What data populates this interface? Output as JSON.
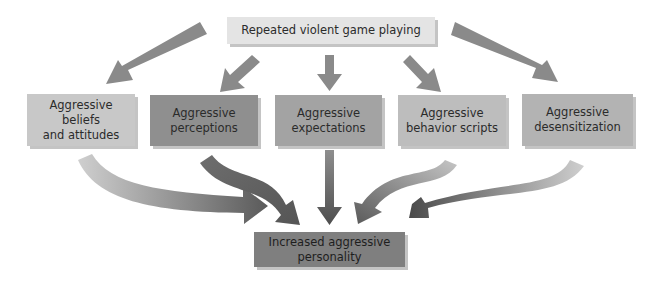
{
  "diagram": {
    "source": {
      "label": "Repeated violent game playing",
      "color": "#e4e4e4"
    },
    "intermediates": [
      {
        "label": "Aggressive beliefs and attitudes",
        "line1": "Aggressive beliefs",
        "line2": "and attitudes",
        "color": "#c8c8c8"
      },
      {
        "label": "Aggressive perceptions",
        "line1": "Aggressive",
        "line2": "perceptions",
        "color": "#8f8f8f"
      },
      {
        "label": "Aggressive expectations",
        "line1": "Aggressive",
        "line2": "expectations",
        "color": "#a3a3a3"
      },
      {
        "label": "Aggressive behavior scripts",
        "line1": "Aggressive",
        "line2": "behavior scripts",
        "color": "#bdbdbd"
      },
      {
        "label": "Aggressive desensitization",
        "line1": "Aggressive",
        "line2": "desensitization",
        "color": "#b3b3b3"
      }
    ],
    "outcome": {
      "label": "Increased aggressive personality",
      "line1": "Increased aggressive",
      "line2": "personality",
      "color": "#7f7f7f"
    },
    "arrow_colors": {
      "top": "#8a8a8a",
      "light": "#c9c9c9",
      "dark": "#555555"
    }
  }
}
